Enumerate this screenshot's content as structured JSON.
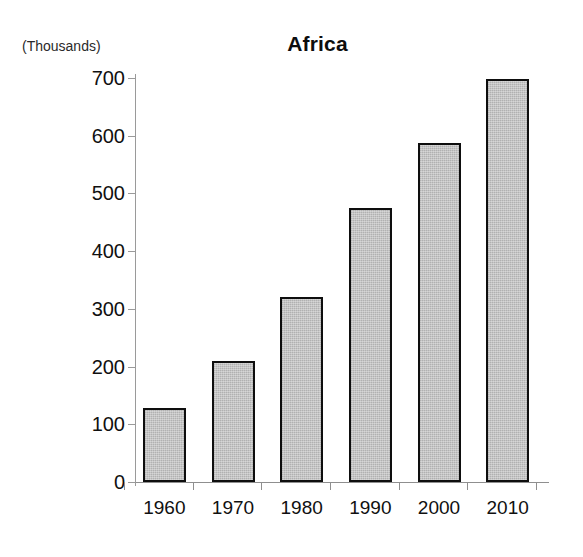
{
  "chart_data": {
    "type": "bar",
    "title": "Africa",
    "units_label": "(Thousands)",
    "xlabel": "",
    "ylabel": "",
    "categories": [
      "1960",
      "1970",
      "1980",
      "1990",
      "2000",
      "2010"
    ],
    "values": [
      128,
      210,
      320,
      475,
      587,
      698
    ],
    "ylim": [
      0,
      700
    ],
    "ytick_labels": [
      "0",
      "100",
      "200",
      "300",
      "400",
      "500",
      "600",
      "700"
    ],
    "ytick_values": [
      0,
      100,
      200,
      300,
      400,
      500,
      600,
      700
    ],
    "grid": false,
    "legend": false,
    "legend_position": "none",
    "series": [
      {
        "name": "Africa",
        "values": [
          128,
          210,
          320,
          475,
          587,
          698
        ]
      }
    ],
    "colors": {
      "bar_fill": "#b9b9b9",
      "bar_border": "#0e0e0e",
      "axis": "#8f8f8f",
      "text": "#101010",
      "background": "#ffffff"
    }
  }
}
